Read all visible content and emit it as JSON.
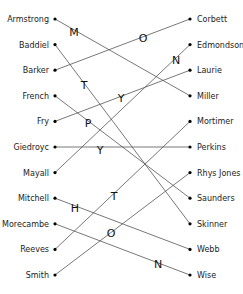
{
  "diagram": {
    "type": "matching",
    "left_names": [
      "Armstrong",
      "Baddiel",
      "Barker",
      "French",
      "Fry",
      "Giedroyc",
      "Mayall",
      "Mitchell",
      "Morecambe",
      "Reeves",
      "Smith"
    ],
    "right_names": [
      "Corbett",
      "Edmondson",
      "Laurie",
      "Miller",
      "Mortimer",
      "Perkins",
      "Rhys Jones",
      "Saunders",
      "Skinner",
      "Webb",
      "Wise"
    ],
    "connections": [
      {
        "left": "Armstrong",
        "right": "Miller",
        "letter": "M"
      },
      {
        "left": "Baddiel",
        "right": "Skinner",
        "letter": "T"
      },
      {
        "left": "Barker",
        "right": "Corbett",
        "letter": "O"
      },
      {
        "left": "French",
        "right": "Saunders",
        "letter": "P"
      },
      {
        "left": "Fry",
        "right": "Laurie",
        "letter": "Y"
      },
      {
        "left": "Giedroyc",
        "right": "Perkins",
        "letter": "Y"
      },
      {
        "left": "Mayall",
        "right": "Edmondson",
        "letter": "N"
      },
      {
        "left": "Mitchell",
        "right": "Webb",
        "letter": "H"
      },
      {
        "left": "Morecambe",
        "right": "Wise",
        "letter": "N"
      },
      {
        "left": "Reeves",
        "right": "Mortimer",
        "letter": "T"
      },
      {
        "left": "Smith",
        "right": "Rhys Jones",
        "letter": "O"
      }
    ],
    "letters": [
      {
        "char": "M",
        "x": 74,
        "y": 32
      },
      {
        "char": "O",
        "x": 143,
        "y": 38
      },
      {
        "char": "N",
        "x": 176,
        "y": 60
      },
      {
        "char": "T",
        "x": 84,
        "y": 85
      },
      {
        "char": "Y",
        "x": 121,
        "y": 98
      },
      {
        "char": "P",
        "x": 88,
        "y": 123
      },
      {
        "char": "Y",
        "x": 100,
        "y": 150
      },
      {
        "char": "T",
        "x": 114,
        "y": 196
      },
      {
        "char": "H",
        "x": 75,
        "y": 208
      },
      {
        "char": "O",
        "x": 111,
        "y": 233
      },
      {
        "char": "N",
        "x": 158,
        "y": 264
      }
    ]
  }
}
